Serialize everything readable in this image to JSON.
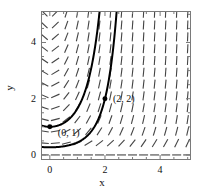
{
  "chart_data": {
    "type": "scatter",
    "subtype": "slope-field-with-solution-curves",
    "title": "",
    "xlabel": "x",
    "ylabel": "y",
    "xlim": [
      -0.32,
      5.12
    ],
    "ylim": [
      -0.18,
      5.12
    ],
    "xticks": [
      0,
      2,
      4
    ],
    "yticks": [
      0,
      2,
      4
    ],
    "xticklabels": [
      "0",
      "2",
      "4"
    ],
    "yticklabels": [
      "0",
      "2",
      "4"
    ],
    "minor_tick_step": 0.5,
    "grid": false,
    "legend": null,
    "frame": true,
    "slope_field": {
      "equation": "dy/dx = x*y",
      "x_start": -0.2,
      "x_step": 0.4,
      "x_count": 14,
      "y_start": 0.0,
      "y_step": 0.42,
      "y_count": 13,
      "dash_length": 9,
      "color": "#444444"
    },
    "curves": [
      {
        "name": "solution-through-0-1",
        "equation": "y = exp(x^2/2)",
        "color": "#000000",
        "width": 2.0,
        "points_x": [
          0.0,
          0.2,
          0.4,
          0.6,
          0.8,
          1.0,
          1.2,
          1.4,
          1.6,
          1.75,
          1.85
        ],
        "points_y": [
          1.0,
          1.02,
          1.083,
          1.197,
          1.377,
          1.649,
          2.054,
          2.664,
          3.597,
          4.557,
          5.12
        ]
      },
      {
        "name": "solution-through-2-2",
        "equation": "y = 2*exp((x^2-4)/2)",
        "color": "#000000",
        "width": 2.0,
        "points_x": [
          -0.3,
          0.2,
          0.6,
          1.0,
          1.4,
          1.8,
          2.0,
          2.2,
          2.4,
          2.55,
          2.67
        ],
        "points_y": [
          0.28,
          0.276,
          0.324,
          0.446,
          0.721,
          1.348,
          2.0,
          3.08,
          5.0,
          6.7,
          8.4
        ]
      }
    ],
    "markers": [
      {
        "name": "point-0-1",
        "x": 0.0,
        "y": 1.0,
        "label": "(0, 1)",
        "label_dx": 8,
        "label_dy": 9,
        "color": "#000000",
        "size": 4
      },
      {
        "name": "point-2-2",
        "x": 2.0,
        "y": 2.0,
        "label": "(2, 2)",
        "label_dx": 8,
        "label_dy": 3,
        "color": "#000000",
        "size": 4
      }
    ]
  }
}
